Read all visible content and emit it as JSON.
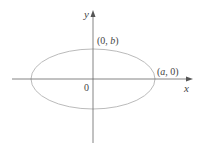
{
  "diagram": {
    "type": "ellipse",
    "axes": {
      "x_label": "x",
      "y_label": "y",
      "origin_label": "0"
    },
    "points": [
      {
        "label_open": "(",
        "label_a": "0",
        "label_comma": ", ",
        "label_b": "b",
        "label_close": ")",
        "name": "top-vertex"
      },
      {
        "label_open": "(",
        "label_a": "a",
        "label_comma": ", ",
        "label_b": "0",
        "label_close": ")",
        "name": "right-vertex"
      }
    ],
    "colors": {
      "axis": "#666666",
      "ellipse": "#bbbbbb",
      "text": "#444444"
    }
  }
}
